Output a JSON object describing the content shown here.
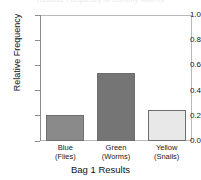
{
  "figure": {
    "clipped_top_caption": "Relative Frequency of Gummy Worms"
  },
  "chart_data": {
    "type": "bar",
    "title": "",
    "xlabel": "Bag 1 Results",
    "ylabel": "Relative Frequency",
    "categories": [
      "Blue",
      "Green",
      "Yellow"
    ],
    "category_sublabels": [
      "(Flies)",
      "(Worms)",
      "(Snails)"
    ],
    "values": [
      0.21,
      0.54,
      0.25
    ],
    "ylim": [
      0.0,
      1.0
    ],
    "ytick_labels": [
      "0.0",
      "0.2",
      "0.4",
      "0.6",
      "0.8",
      "1.0"
    ],
    "ytick_values": [
      0.0,
      0.2,
      0.4,
      0.6,
      0.8,
      1.0
    ],
    "grid": false,
    "legend": "none",
    "bar_colors": [
      "#8a8a8a",
      "#757575",
      "#e8e8e8"
    ],
    "bar_edge_color": "#6e6e6e",
    "frame_color": "#b9b9b9",
    "axis_color": "#8c8c8c"
  }
}
